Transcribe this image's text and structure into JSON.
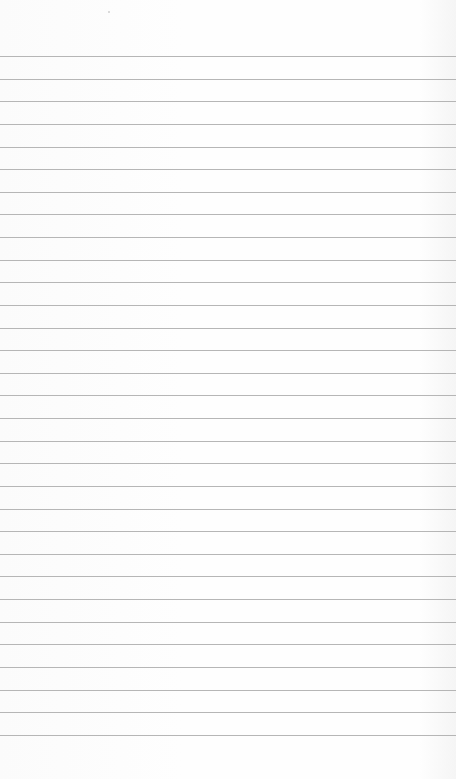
{
  "page": {
    "type": "lined-paper",
    "rule_count": 31,
    "colors": {
      "paper": "#fdfdfd",
      "rule": "#a9a9a9"
    }
  }
}
